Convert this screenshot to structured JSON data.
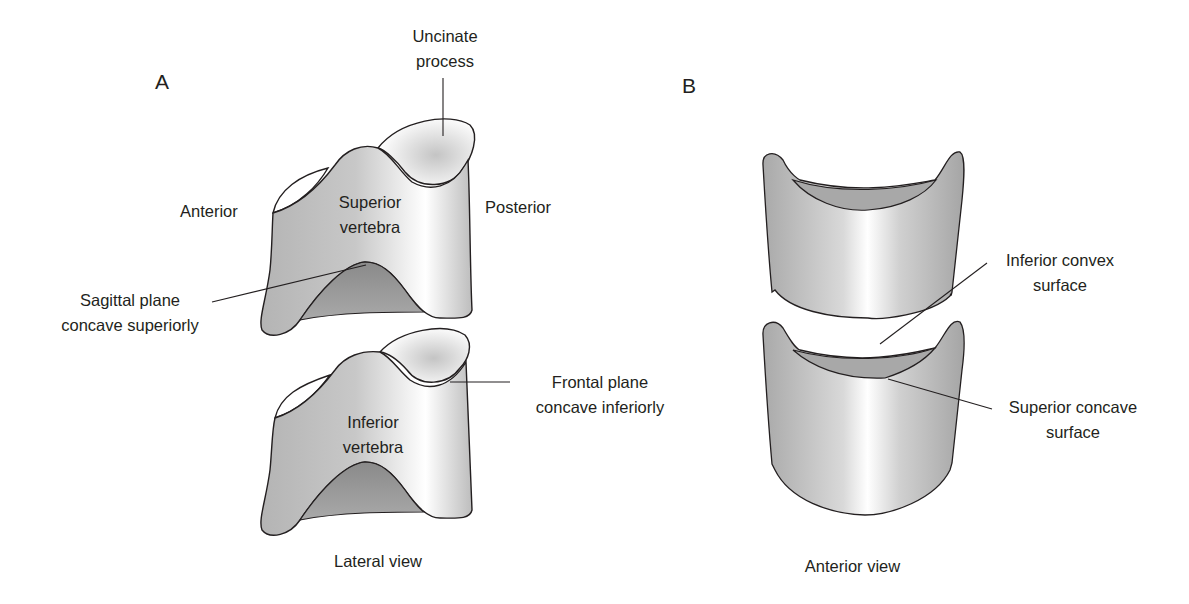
{
  "panels": {
    "a": {
      "letter": "A",
      "caption": "Lateral view",
      "labels": {
        "uncinate_1": "Uncinate",
        "uncinate_2": "process",
        "anterior": "Anterior",
        "posterior": "Posterior",
        "superior_1": "Superior",
        "superior_2": "vertebra",
        "inferior_1": "Inferior",
        "inferior_2": "vertebra",
        "sagittal_1": "Sagittal plane",
        "sagittal_2": "concave superiorly",
        "frontal_1": "Frontal plane",
        "frontal_2": "concave inferiorly"
      }
    },
    "b": {
      "letter": "B",
      "caption": "Anterior view",
      "labels": {
        "inf_convex_1": "Inferior convex",
        "inf_convex_2": "surface",
        "sup_concave_1": "Superior concave",
        "sup_concave_2": "surface"
      }
    }
  },
  "colors": {
    "outline": "#231f20",
    "shade_dark": "#8f8f8f",
    "shade_mid": "#b9b9b9",
    "highlight": "#ffffff"
  }
}
